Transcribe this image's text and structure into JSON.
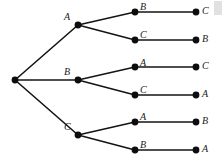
{
  "diagram": {
    "type": "tree",
    "canvas": {
      "width": 224,
      "height": 163
    },
    "colors": {
      "background": "#ffffff",
      "node": "#0d0d0d",
      "edge": "#141414",
      "label": "#1a1a1a",
      "artifact": "#c9c9c9"
    },
    "style": {
      "node_radius": 3.4,
      "edge_width": 1.6,
      "label_font_size": 10,
      "label_italic": true
    },
    "root": {
      "id": "root",
      "label": "",
      "x": 15,
      "y": 80
    },
    "level1": [
      {
        "id": "l1-a",
        "label": "A",
        "x": 78,
        "y": 25,
        "label_x": 64,
        "label_y": 12
      },
      {
        "id": "l1-b",
        "label": "B",
        "x": 78,
        "y": 80,
        "label_x": 64,
        "label_y": 67
      },
      {
        "id": "l1-c",
        "label": "C",
        "x": 78,
        "y": 135,
        "label_x": 64,
        "label_y": 122
      },
      {
        "id": "l2-1",
        "label": "B",
        "x": 135,
        "y": 12,
        "label_x": 140,
        "label_y": 2
      },
      {
        "id": "l2-2",
        "label": "C",
        "x": 135,
        "y": 40,
        "label_x": 140,
        "label_y": 30
      },
      {
        "id": "l2-3",
        "label": "A",
        "x": 135,
        "y": 67,
        "label_x": 140,
        "label_y": 58
      },
      {
        "id": "l2-4",
        "label": "C",
        "x": 135,
        "y": 95,
        "label_x": 140,
        "label_y": 85
      },
      {
        "id": "l2-5",
        "label": "A",
        "x": 135,
        "y": 122,
        "label_x": 140,
        "label_y": 112
      },
      {
        "id": "l2-6",
        "label": "B",
        "x": 135,
        "y": 150,
        "label_x": 140,
        "label_y": 140
      },
      {
        "id": "l3-1",
        "label": "C",
        "x": 196,
        "y": 12,
        "label_x": 202,
        "label_y": 6
      },
      {
        "id": "l3-2",
        "label": "B",
        "x": 196,
        "y": 40,
        "label_x": 202,
        "label_y": 34
      },
      {
        "id": "l3-3",
        "label": "C",
        "x": 196,
        "y": 67,
        "label_x": 202,
        "label_y": 61
      },
      {
        "id": "l3-4",
        "label": "A",
        "x": 196,
        "y": 95,
        "label_x": 202,
        "label_y": 89
      },
      {
        "id": "l3-5",
        "label": "B",
        "x": 196,
        "y": 122,
        "label_x": 202,
        "label_y": 116
      },
      {
        "id": "l3-6",
        "label": "A",
        "x": 196,
        "y": 150,
        "label_x": 202,
        "label_y": 144
      }
    ],
    "edges": [
      {
        "id": "e-root-a",
        "from": "root",
        "to": "l1-a",
        "x1": 15,
        "y1": 80,
        "x2": 78,
        "y2": 25
      },
      {
        "id": "e-root-b",
        "from": "root",
        "to": "l1-b",
        "x1": 15,
        "y1": 80,
        "x2": 78,
        "y2": 80
      },
      {
        "id": "e-root-c",
        "from": "root",
        "to": "l1-c",
        "x1": 15,
        "y1": 80,
        "x2": 78,
        "y2": 135
      },
      {
        "id": "e-a-1",
        "from": "l1-a",
        "to": "l2-1",
        "x1": 78,
        "y1": 25,
        "x2": 135,
        "y2": 12
      },
      {
        "id": "e-a-2",
        "from": "l1-a",
        "to": "l2-2",
        "x1": 78,
        "y1": 25,
        "x2": 135,
        "y2": 40
      },
      {
        "id": "e-b-3",
        "from": "l1-b",
        "to": "l2-3",
        "x1": 78,
        "y1": 80,
        "x2": 135,
        "y2": 67
      },
      {
        "id": "e-b-4",
        "from": "l1-b",
        "to": "l2-4",
        "x1": 78,
        "y1": 80,
        "x2": 135,
        "y2": 95
      },
      {
        "id": "e-c-5",
        "from": "l1-c",
        "to": "l2-5",
        "x1": 78,
        "y1": 135,
        "x2": 135,
        "y2": 122
      },
      {
        "id": "e-c-6",
        "from": "l1-c",
        "to": "l2-6",
        "x1": 78,
        "y1": 135,
        "x2": 135,
        "y2": 150
      },
      {
        "id": "e-leaf-1",
        "from": "l2-1",
        "to": "l3-1",
        "x1": 135,
        "y1": 12,
        "x2": 196,
        "y2": 12
      },
      {
        "id": "e-leaf-2",
        "from": "l2-2",
        "to": "l3-2",
        "x1": 135,
        "y1": 40,
        "x2": 196,
        "y2": 40
      },
      {
        "id": "e-leaf-3",
        "from": "l2-3",
        "to": "l3-3",
        "x1": 135,
        "y1": 67,
        "x2": 196,
        "y2": 67
      },
      {
        "id": "e-leaf-4",
        "from": "l2-4",
        "to": "l3-4",
        "x1": 135,
        "y1": 95,
        "x2": 196,
        "y2": 95
      },
      {
        "id": "e-leaf-5",
        "from": "l2-5",
        "to": "l3-5",
        "x1": 135,
        "y1": 122,
        "x2": 196,
        "y2": 122
      },
      {
        "id": "e-leaf-6",
        "from": "l2-6",
        "to": "l3-6",
        "x1": 135,
        "y1": 150,
        "x2": 196,
        "y2": 150
      }
    ],
    "paths": [
      [
        "A",
        "B",
        "C"
      ],
      [
        "A",
        "C",
        "B"
      ],
      [
        "B",
        "A",
        "C"
      ],
      [
        "B",
        "C",
        "A"
      ],
      [
        "C",
        "A",
        "B"
      ],
      [
        "C",
        "B",
        "A"
      ]
    ],
    "artifact": {
      "x": 214,
      "y": 1,
      "width": 8,
      "height": 14
    }
  }
}
